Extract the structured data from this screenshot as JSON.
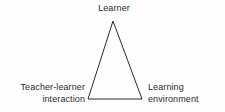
{
  "diagram": {
    "type": "triangle-relationship-diagram",
    "background_color": "#fefefe",
    "stroke_color": "#2b2b2b",
    "text_color": "#2b2b2b",
    "nodes": [
      {
        "id": "learner",
        "label": "Learner",
        "position": "apex-top-center"
      },
      {
        "id": "teacher_learner_interaction",
        "label": "Teacher-learner\ninteraction",
        "position": "bottom-left"
      },
      {
        "id": "learning_environment",
        "label": "Learning\nenvironment",
        "position": "bottom-right"
      }
    ],
    "shape": {
      "apex": [
        113,
        21
      ],
      "bottom_left": [
        88,
        99
      ],
      "bottom_right": [
        142,
        99
      ],
      "stroke_width": 1
    }
  }
}
